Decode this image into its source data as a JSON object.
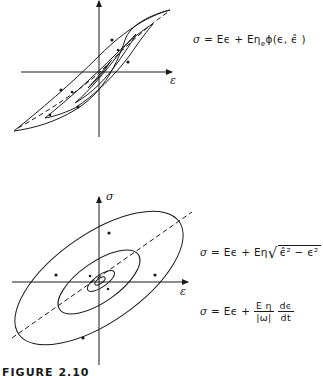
{
  "figure": {
    "caption": "FIGURE 2.10",
    "top_panel": {
      "x_axis_label": "ε",
      "equation": {
        "lhs": "σ",
        "rhs_part1": "= Eϵ + Eη",
        "subscript": "e",
        "rhs_part2": "ϕ(ϵ, ϵ̂ )"
      }
    },
    "bottom_panel": {
      "x_axis_label": "ε",
      "y_axis_label": "σ",
      "equation_1": {
        "lhs": "σ",
        "rhs": "= Eϵ + Eη",
        "sqrt_content": "ϵ̂² − ϵ²"
      },
      "equation_2": {
        "lhs": "σ",
        "rhs": "= Eϵ +",
        "frac1_num": "E η",
        "frac1_den": "|ω|",
        "frac2_num": "dϵ",
        "frac2_den": "dt"
      }
    }
  }
}
